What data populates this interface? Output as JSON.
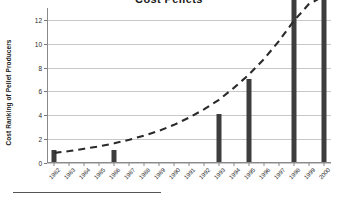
{
  "chart_data": {
    "type": "bar",
    "title": "Cost Pellets",
    "xlabel": "",
    "ylabel": "Cost Ranking of Pellet Producers",
    "categories": [
      "1982",
      "1983",
      "1984",
      "1985",
      "1986",
      "1987",
      "1988",
      "1989",
      "1990",
      "1991",
      "1992",
      "1993",
      "1994",
      "1995",
      "1996",
      "1997",
      "1998",
      "1999",
      "2000"
    ],
    "values": [
      1,
      0,
      0,
      0,
      1,
      0,
      0,
      0,
      0,
      0,
      0,
      4,
      0,
      7,
      0,
      0,
      13,
      0,
      13
    ],
    "ylim": [
      0,
      13
    ],
    "yticks": [
      0,
      2,
      4,
      6,
      8,
      10,
      12
    ],
    "grid": true,
    "legend": "none",
    "series": [
      {
        "name": "Cost Ranking of Pellet Producers",
        "type": "bar",
        "color": "#3d3d3d",
        "values": [
          1,
          0,
          0,
          0,
          1,
          0,
          0,
          0,
          0,
          0,
          0,
          4,
          0,
          7,
          0,
          0,
          13,
          0,
          13
        ]
      },
      {
        "name": "Trend",
        "type": "line",
        "style": "dashed",
        "color": "#2a2a2a",
        "values": [
          0.85,
          1.0,
          1.2,
          1.4,
          1.65,
          1.95,
          2.3,
          2.7,
          3.2,
          3.8,
          4.5,
          5.3,
          6.3,
          7.4,
          8.7,
          10.2,
          11.9,
          13.3,
          14.0
        ]
      }
    ],
    "annotations": []
  },
  "axis": {
    "ytick_labels": [
      "0",
      "2",
      "4",
      "6",
      "8",
      "10",
      "12"
    ],
    "xtick_labels": [
      "1982",
      "1983",
      "1984",
      "1985",
      "1986",
      "1987",
      "1988",
      "1989",
      "1990",
      "1991",
      "1992",
      "1993",
      "1994",
      "1995",
      "1996",
      "1997",
      "1998",
      "1999",
      "2000"
    ]
  },
  "colors": {
    "bar": "#3d3d3d",
    "trend": "#2a2a2a",
    "grid": "#c8c8c8",
    "axis": "#8a8a8a",
    "text": "#1a1a1a",
    "background": "#ffffff"
  }
}
